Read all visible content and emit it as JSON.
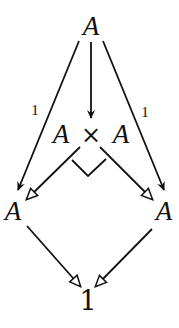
{
  "diagram": {
    "type": "commutative-diagram",
    "nodes": {
      "top": "A",
      "product": {
        "left": "A",
        "op": "×",
        "right": "A"
      },
      "left": "A",
      "right": "A",
      "terminal": "1"
    },
    "edges": [
      {
        "from": "top",
        "to": "product",
        "label": "",
        "style": "solid-arrow"
      },
      {
        "from": "top",
        "to": "left",
        "label": "1",
        "style": "solid-arrow"
      },
      {
        "from": "top",
        "to": "right",
        "label": "1",
        "style": "solid-arrow"
      },
      {
        "from": "product",
        "to": "left",
        "label": "",
        "style": "open-arrow"
      },
      {
        "from": "product",
        "to": "right",
        "label": "",
        "style": "open-arrow"
      },
      {
        "from": "left",
        "to": "terminal",
        "label": "",
        "style": "open-arrow"
      },
      {
        "from": "right",
        "to": "terminal",
        "label": "",
        "style": "open-arrow"
      }
    ],
    "labels": {
      "left_identity": "1",
      "right_identity": "1"
    },
    "pullback_marker": "corner",
    "colors": {
      "ink": "#111111",
      "background": "#ffffff"
    }
  }
}
